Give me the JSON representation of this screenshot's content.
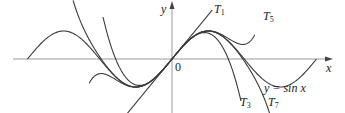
{
  "figure": {
    "axes": {
      "x_label": "x",
      "y_label": "y",
      "origin_label": "0"
    },
    "curves": [
      {
        "id": "sin",
        "label": "y = sin x"
      },
      {
        "id": "T1",
        "label": "T",
        "sub": "1"
      },
      {
        "id": "T3",
        "label": "T",
        "sub": "3"
      },
      {
        "id": "T5",
        "label": "T",
        "sub": "5"
      },
      {
        "id": "T7",
        "label": "T",
        "sub": "7"
      }
    ],
    "colors": {
      "axis": "#9a9a9a",
      "curve": "#3a3a3a"
    }
  }
}
